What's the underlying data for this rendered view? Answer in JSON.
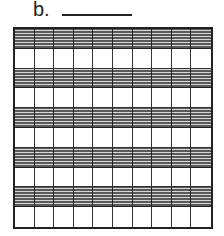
{
  "problem": {
    "label": "b.",
    "answer_blank": ""
  },
  "grid": {
    "rows": 10,
    "columns": 10,
    "total_squares": 100,
    "shaded_rows": [
      1,
      3,
      5,
      7,
      9
    ],
    "shaded_squares": 50,
    "shade_color": "#5a5a5a",
    "line_color": "#222222"
  }
}
